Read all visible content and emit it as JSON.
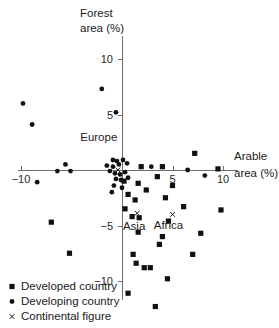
{
  "chart_data": {
    "type": "scatter",
    "title": "",
    "xlabel": "Arable area (%)",
    "ylabel": "Forest area (%)",
    "xlim": [
      -12.5,
      12.5
    ],
    "ylim": [
      -13.5,
      12.5
    ],
    "xticks": [
      -10,
      5,
      10
    ],
    "yticks": [
      10,
      5,
      -5,
      -10
    ],
    "xtick_labels": [
      "−10",
      "5",
      "10"
    ],
    "ytick_labels": [
      "10",
      "5",
      "−5",
      "−10"
    ],
    "grid": false,
    "legend_position": "bottom-left",
    "axes_style": "crossed-at-origin",
    "series": [
      {
        "name": "Developed country",
        "marker": "square",
        "color": "#111111",
        "points": [
          [
            1.9,
            0.3
          ],
          [
            4.0,
            0.3
          ],
          [
            7.2,
            1.5
          ],
          [
            9.5,
            0.1
          ],
          [
            0.2,
            -1.0
          ],
          [
            1.6,
            -1.2
          ],
          [
            3.5,
            -0.6
          ],
          [
            5.0,
            -1.4
          ],
          [
            0.6,
            -2.2
          ],
          [
            1.3,
            -2.7
          ],
          [
            4.3,
            -2.5
          ],
          [
            2.4,
            -1.8
          ],
          [
            0.3,
            -3.5
          ],
          [
            6.1,
            -3.3
          ],
          [
            9.8,
            -3.6
          ],
          [
            1.0,
            -4.2
          ],
          [
            1.7,
            -4.3
          ],
          [
            4.6,
            -4.6
          ],
          [
            -7.0,
            -4.7
          ],
          [
            1.6,
            -5.6
          ],
          [
            4.0,
            -6.0
          ],
          [
            7.8,
            -5.7
          ],
          [
            3.7,
            -6.7
          ],
          [
            1.1,
            -7.6
          ],
          [
            -5.2,
            -7.5
          ],
          [
            7.0,
            -7.6
          ],
          [
            1.4,
            -8.4
          ],
          [
            2.2,
            -8.8
          ],
          [
            2.8,
            -8.8
          ],
          [
            4.5,
            -9.8
          ],
          [
            0.6,
            -11.1
          ],
          [
            3.3,
            -12.3
          ]
        ]
      },
      {
        "name": "Developing country",
        "marker": "circle",
        "color": "#111111",
        "points": [
          [
            -9.8,
            6.0
          ],
          [
            -8.9,
            4.1
          ],
          [
            -2.0,
            7.3
          ],
          [
            -0.6,
            5.2
          ],
          [
            -5.6,
            0.5
          ],
          [
            -0.9,
            0.9
          ],
          [
            -0.5,
            0.8
          ],
          [
            -1.5,
            0.4
          ],
          [
            -0.9,
            0.3
          ],
          [
            -0.3,
            0.5
          ],
          [
            0.1,
            0.9
          ],
          [
            0.5,
            0.6
          ],
          [
            -1.2,
            -0.1
          ],
          [
            -0.7,
            -0.3
          ],
          [
            -0.2,
            -0.4
          ],
          [
            0.3,
            -0.2
          ],
          [
            -0.6,
            -0.8
          ],
          [
            -0.1,
            -0.9
          ],
          [
            0.6,
            -0.7
          ],
          [
            2.9,
            0.3
          ],
          [
            -6.4,
            -0.1
          ],
          [
            -5.1,
            -0.1
          ],
          [
            -0.8,
            -1.4
          ],
          [
            -1.0,
            -2.0
          ],
          [
            -8.4,
            -1.1
          ],
          [
            6.5,
            0.0
          ],
          [
            8.2,
            -0.5
          ],
          [
            0.0,
            -1.6
          ]
        ]
      },
      {
        "name": "Continental figure",
        "marker": "cross",
        "color": "#111111",
        "points": [
          [
            -0.4,
            0.0
          ],
          [
            1.5,
            -3.9
          ],
          [
            5.0,
            -4.0
          ]
        ]
      }
    ],
    "annotations": [
      {
        "text": "Europe",
        "x": -2.3,
        "y": 2.6
      },
      {
        "text": "Asia",
        "x": 1.2,
        "y": -5.4
      },
      {
        "text": "Africa",
        "x": 4.6,
        "y": -5.3
      }
    ],
    "legend": [
      {
        "label": "Developed country",
        "marker": "square"
      },
      {
        "label": "Developing country",
        "marker": "circle"
      },
      {
        "label": "Continental figure",
        "marker": "cross"
      }
    ]
  }
}
